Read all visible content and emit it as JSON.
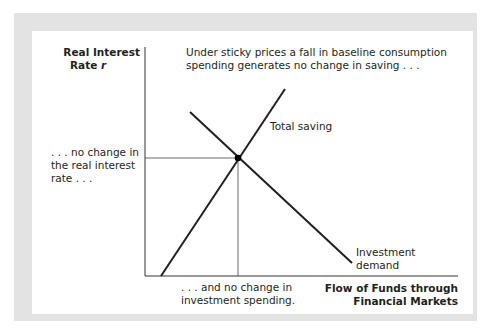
{
  "diagram": {
    "y_axis_label": {
      "line1": "Real Interest",
      "line2_text": "Rate ",
      "line2_var": "r"
    },
    "x_axis_label": {
      "line1": "Flow of Funds through",
      "line2": "Financial Markets"
    },
    "title_note": {
      "line1": "Under sticky prices a fall in baseline consumption",
      "line2": "spending generates no change in saving . . ."
    },
    "left_note": {
      "line1": ". . . no change in",
      "line2": "the real interest",
      "line3": "rate . . ."
    },
    "bottom_note": {
      "line1": ". . . and no change in",
      "line2": "investment spending."
    },
    "curves": [
      {
        "name": "Total saving",
        "slope": "upward"
      },
      {
        "name_line1": "Investment",
        "name_line2": "demand",
        "slope": "downward"
      }
    ],
    "equilibrium": {
      "marker": "dot",
      "guides": "dropped to both axes"
    }
  }
}
